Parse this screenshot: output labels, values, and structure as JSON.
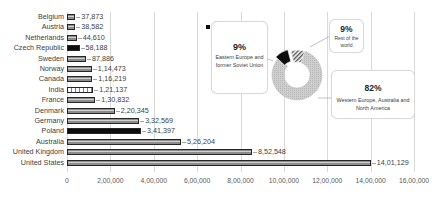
{
  "chart_data": [
    {
      "type": "bar",
      "orientation": "horizontal",
      "title": "",
      "xlabel": "",
      "ylabel": "",
      "categories": [
        "Belgium",
        "Austria",
        "Netherlands",
        "Czech Republic",
        "Sweden",
        "Norway",
        "Canada",
        "India",
        "France",
        "Denmark",
        "Germany",
        "Poland",
        "Australia",
        "United Kingdom",
        "United States"
      ],
      "values": [
        37873,
        38582,
        44610,
        58188,
        87886,
        114473,
        116219,
        121137,
        130832,
        220345,
        332569,
        341397,
        526204,
        852548,
        1401129
      ],
      "value_labels": [
        "37,873",
        "38,582",
        "44,610",
        "58,188",
        "87,886",
        "1,14,473",
        "1,16,219",
        "1,21,137",
        "1,30,832",
        "2,20,345",
        "3,32,569",
        "3,41,397",
        "5,26,204",
        "8,52,548",
        "14,01,129"
      ],
      "bar_styles": [
        "striped",
        "striped",
        "striped",
        "solid",
        "striped",
        "striped",
        "striped",
        "dashed",
        "striped",
        "striped",
        "striped",
        "solid",
        "striped",
        "striped",
        "striped"
      ],
      "xlim": [
        0,
        1600000
      ],
      "xticks": [
        0,
        200000,
        400000,
        600000,
        800000,
        1000000,
        1200000,
        1400000,
        1600000
      ],
      "xtick_labels": [
        "0",
        "2,00,000",
        "4,00,000",
        "6,00,000",
        "8,00,000",
        "10,00,000",
        "12,00,000",
        "14,00,000",
        "16,00,000"
      ],
      "grid": "vertical",
      "data_labels": true,
      "legend": null
    },
    {
      "type": "pie",
      "variant": "donut",
      "slices": [
        {
          "label": "Western Europe, Australia and North America",
          "value": 82,
          "value_label": "82%",
          "style": "light-grey"
        },
        {
          "label": "Eastern Europe and former Soviet Union",
          "value": 9,
          "value_label": "9%",
          "style": "black"
        },
        {
          "label": "Rest of the world",
          "value": 9,
          "value_label": "9%",
          "style": "hatched"
        }
      ],
      "data_labels": "callouts",
      "legend": null
    }
  ],
  "callouts": {
    "eastern": {
      "pct": "9%",
      "desc": "Eastern Europe and former Soviet Union"
    },
    "rest": {
      "pct": "9%",
      "desc": "Rest of the world"
    },
    "western": {
      "pct": "82%",
      "desc": "Western Europe, Australia and North America"
    }
  },
  "colors": {
    "bar_fill": "#8c8c8c",
    "bar_border": "#262626",
    "solid_bar": "#0d0d0d",
    "donut_main": "#c8c8c8",
    "gridline": "#d9d9d9",
    "text": "#404040"
  }
}
